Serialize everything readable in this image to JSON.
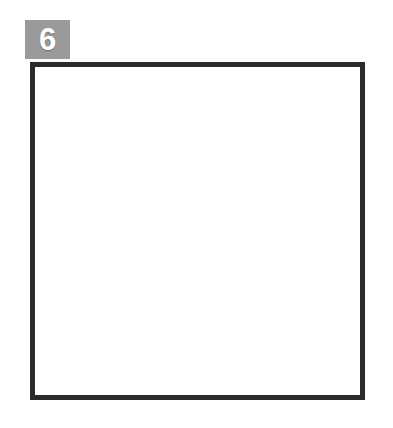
{
  "figure": {
    "number_label": "6",
    "badge_color": "#9a9a9a",
    "badge_text_color": "#ffffff",
    "frame_color": "#2b2b2b",
    "background_color": "#ffffff",
    "caption": ""
  },
  "artwork": {
    "name": "flower-of-life-hexagonal-lattice",
    "title": "",
    "ink_color": "#231f20",
    "shadow_color": "#9b9b9b",
    "stroke_width": 5.2,
    "shadow_stroke_width": 5.0,
    "circle_radius": 29.5,
    "grid_spacing_x": 51,
    "grid_spacing_y": 44.5,
    "shadow_offset_x": 7,
    "shadow_offset_y": 6,
    "hex_rings": 3,
    "center_x": 168,
    "center_y": 170,
    "viewbox": "0 0 335 338"
  }
}
